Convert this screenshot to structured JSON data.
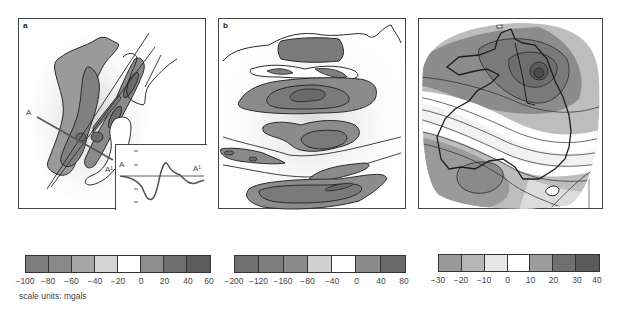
{
  "figure": {
    "panels": [
      {
        "label": "a",
        "section_start": "A",
        "section_end": "A¹",
        "inset_start": "A",
        "inset_end": "A¹"
      },
      {
        "label": "b"
      },
      {
        "label": ""
      }
    ],
    "scales": [
      {
        "ticks": [
          "−100",
          "−80",
          "−60",
          "−40",
          "−20",
          "0",
          "20",
          "40",
          "60"
        ],
        "colors": [
          "#7d7d7d",
          "#8a8a8a",
          "#a6a6a6",
          "#d4d4d4",
          "#ffffff",
          "#8e8e8e",
          "#6e6e6e",
          "#5c5c5c"
        ]
      },
      {
        "ticks": [
          "−200",
          "−120",
          "−160",
          "−80",
          "−40",
          "0",
          "40",
          "80"
        ],
        "colors": [
          "#6f6f6f",
          "#7e7e7e",
          "#8c8c8c",
          "#d2d2d2",
          "#ffffff",
          "#8c8c8c",
          "#6a6a6a"
        ]
      },
      {
        "ticks": [
          "−30",
          "−20",
          "−10",
          "0",
          "10",
          "20",
          "30",
          "40"
        ],
        "colors": [
          "#9a9a9a",
          "#b5b5b5",
          "#e6e6e6",
          "#ffffff",
          "#9c9c9c",
          "#707070",
          "#5a5a5a"
        ]
      }
    ],
    "scale_units": "scale units: mgals"
  }
}
